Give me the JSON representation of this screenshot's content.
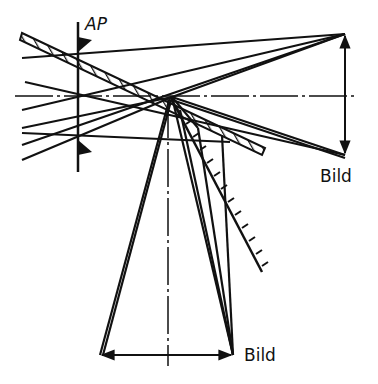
{
  "diagram": {
    "type": "optical ray diagram (mirror deflection)",
    "labels": {
      "aperture": "AP",
      "image_right": "Bild",
      "image_bottom": "Bild"
    },
    "colors": {
      "line": "#111111",
      "background": "#ffffff"
    }
  }
}
